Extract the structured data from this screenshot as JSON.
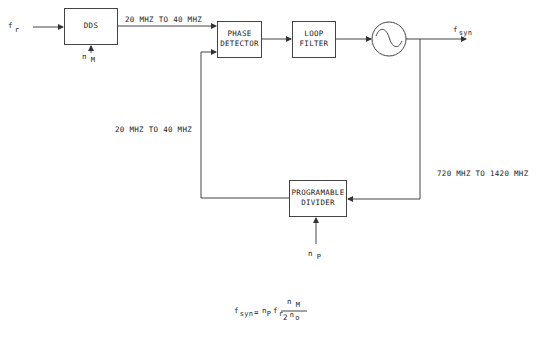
{
  "diagram": {
    "inputs": {
      "reference": {
        "symbol": "f",
        "subscript": "r"
      },
      "dds_control": {
        "symbol": "n",
        "subscript": "M"
      },
      "divider_control": {
        "symbol": "n",
        "subscript": "P"
      }
    },
    "output": {
      "symbol": "f",
      "subscript": "syn"
    },
    "blocks": [
      {
        "id": "dds",
        "line1": "DDS",
        "line2": ""
      },
      {
        "id": "phase_detector",
        "line1": "PHASE",
        "line2": "DETECTOR"
      },
      {
        "id": "loop_filter",
        "line1": "LOOP",
        "line2": "FILTER"
      },
      {
        "id": "vco",
        "line1": "",
        "line2": "",
        "shape": "circle-with-sine"
      },
      {
        "id": "programmable_divider",
        "line1": "PROGRAMABLE",
        "line2": "DIVIDER"
      }
    ],
    "edge_labels": {
      "dds_to_pd": "20 MHZ TO 40 MHZ",
      "feedback": "20 MHZ TO 40 MHZ",
      "vco_to_divider": "720 MHZ TO 1420 MHZ"
    },
    "formula": {
      "lhs_symbol": "f",
      "lhs_sub": "syn",
      "equals": "=",
      "term1_symbol": "n",
      "term1_sub": "P",
      "term2_symbol": "f",
      "term2_sub": "r",
      "numerator_symbol": "n",
      "numerator_sub": "M",
      "denominator_base": "2",
      "denominator_exp_symbol": "n",
      "denominator_exp_sub": "o"
    },
    "colors": {
      "line": "#333333",
      "text": "#222222",
      "background": "#ffffff"
    }
  }
}
